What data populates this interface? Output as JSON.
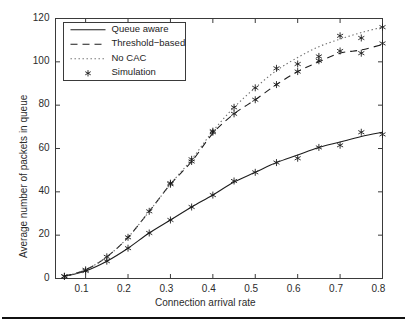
{
  "figure": {
    "background_color": "#ffffff",
    "axis_color": "#3a3a3a",
    "footer_rule": true
  },
  "chart_data": {
    "type": "line",
    "title": "",
    "xlabel": "Connection arrival rate",
    "ylabel": "Average number of packets in queue",
    "xlim": [
      0.029,
      0.8
    ],
    "ylim": [
      0,
      120
    ],
    "xticks": [
      "0.1",
      "0.2",
      "0.3",
      "0.4",
      "0.5",
      "0.6",
      "0.7",
      "0.8"
    ],
    "xtick_values": [
      0.1,
      0.2,
      0.3,
      0.4,
      0.5,
      0.6,
      0.7,
      0.8
    ],
    "yticks": [
      "0",
      "20",
      "40",
      "60",
      "80",
      "100",
      "120"
    ],
    "ytick_values": [
      0,
      20,
      40,
      60,
      80,
      100,
      120
    ],
    "grid": false,
    "legend_position": "upper left",
    "legend": [
      {
        "label": "Queue aware",
        "style": "solid",
        "color": "#1d1d1d"
      },
      {
        "label": "Threshold−based",
        "style": "dashed",
        "color": "#1d1d1d"
      },
      {
        "label": "No CAC",
        "style": "dotted",
        "color": "#6e6e6e"
      },
      {
        "label": "Simulation",
        "style": "marker",
        "marker": "asterisk",
        "color": "#1d1d1d"
      }
    ],
    "series": [
      {
        "name": "Queue aware",
        "style": "solid",
        "x": [
          0.05,
          0.1,
          0.15,
          0.2,
          0.25,
          0.3,
          0.35,
          0.4,
          0.45,
          0.5,
          0.55,
          0.6,
          0.65,
          0.7,
          0.75,
          0.8
        ],
        "values": [
          1.0,
          3.5,
          8.0,
          14.0,
          21.0,
          27.0,
          33.0,
          38.5,
          44.5,
          49.0,
          53.5,
          57.0,
          60.5,
          63.0,
          65.5,
          67.5
        ]
      },
      {
        "name": "Threshold−based",
        "style": "dashed",
        "x": [
          0.05,
          0.1,
          0.15,
          0.2,
          0.25,
          0.3,
          0.35,
          0.4,
          0.45,
          0.5,
          0.55,
          0.6,
          0.65,
          0.7,
          0.75,
          0.8
        ],
        "values": [
          1.0,
          4.0,
          10.0,
          19.0,
          31.0,
          43.5,
          54.0,
          67.0,
          76.0,
          82.5,
          89.5,
          95.5,
          100.0,
          104.0,
          105.5,
          108.0
        ]
      },
      {
        "name": "No CAC",
        "style": "dotted",
        "x": [
          0.05,
          0.1,
          0.15,
          0.2,
          0.25,
          0.3,
          0.35,
          0.4,
          0.45,
          0.5,
          0.55,
          0.6,
          0.65,
          0.7,
          0.75,
          0.8
        ],
        "values": [
          1.0,
          4.0,
          10.0,
          19.0,
          31.0,
          43.5,
          55.0,
          68.0,
          79.0,
          88.0,
          96.0,
          102.0,
          107.0,
          110.5,
          113.5,
          116.0
        ]
      },
      {
        "name": "Simulation",
        "style": "marker",
        "marker": "asterisk",
        "x": [
          0.05,
          0.1,
          0.15,
          0.2,
          0.25,
          0.3,
          0.35,
          0.4,
          0.45,
          0.5,
          0.55,
          0.6,
          0.65,
          0.7,
          0.75,
          0.8,
          0.05,
          0.1,
          0.15,
          0.2,
          0.25,
          0.3,
          0.35,
          0.4,
          0.45,
          0.5,
          0.55,
          0.6,
          0.65,
          0.7,
          0.75,
          0.8,
          0.3,
          0.35,
          0.4,
          0.45,
          0.5,
          0.55,
          0.6,
          0.65,
          0.7,
          0.75,
          0.8
        ],
        "values": [
          1.0,
          3.5,
          8.0,
          14.0,
          21.0,
          27.0,
          33.0,
          38.5,
          45.0,
          49.0,
          53.5,
          55.5,
          60.5,
          61.5,
          67.5,
          66.5,
          1.0,
          4.0,
          10.0,
          19.0,
          31.0,
          43.5,
          54.0,
          67.5,
          76.0,
          82.5,
          89.5,
          95.5,
          100.5,
          105.0,
          104.0,
          108.5,
          44.0,
          55.0,
          68.0,
          79.0,
          88.0,
          97.0,
          99.0,
          102.5,
          112.0,
          111.0,
          116.0
        ]
      }
    ]
  }
}
